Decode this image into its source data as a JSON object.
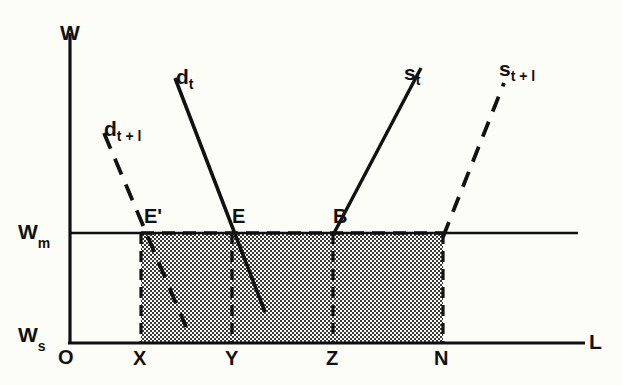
{
  "figure": {
    "type": "economics-supply-demand-diagram",
    "background_color": "#fdfdf8",
    "line_color": "#111111",
    "shade_fill": "#b9b9b9",
    "axes": {
      "y_axis_label": "W",
      "x_axis_label": "L",
      "origin_label": "O",
      "wage_market_label": "W",
      "wage_market_sub": "m",
      "wage_subsistence_label": "W",
      "wage_subsistence_sub": "s"
    },
    "x_ticks": [
      {
        "label": "X",
        "x": 141
      },
      {
        "label": "Y",
        "x": 232
      },
      {
        "label": "Z",
        "x": 333
      },
      {
        "label": "N",
        "x": 443
      }
    ],
    "curves": [
      {
        "name": "demand-t",
        "label": "d",
        "sub": "t",
        "style": "solid",
        "x1": 175,
        "y1": 78,
        "x2": 265,
        "y2": 312
      },
      {
        "name": "demand-t1",
        "label": "d",
        "sub": "t + l",
        "style": "dashed",
        "x1": 104,
        "y1": 133,
        "x2": 186,
        "y2": 327
      },
      {
        "name": "supply-t",
        "label": "s",
        "sub": "t",
        "style": "solid",
        "x1": 333,
        "y1": 233,
        "x2": 421,
        "y2": 68
      },
      {
        "name": "supply-t1",
        "label": "s",
        "sub": "t + l",
        "style": "dashed",
        "x1": 443,
        "y1": 233,
        "x2": 504,
        "y2": 83
      }
    ],
    "points": [
      {
        "label": "E'",
        "x": 141,
        "y": 233
      },
      {
        "label": "E",
        "x": 232,
        "y": 233
      },
      {
        "label": "B",
        "x": 333,
        "y": 233
      }
    ],
    "shaded_region": {
      "name": "unemployment-rent-area",
      "x_left": 141,
      "x_right": 443,
      "y_top": 233,
      "y_bottom": 343
    }
  }
}
